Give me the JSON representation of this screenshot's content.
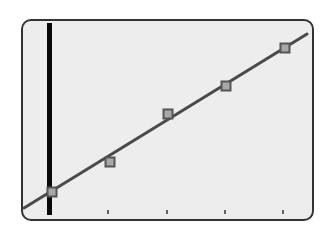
{
  "chart_data": {
    "type": "scatter",
    "title": "",
    "xlabel": "",
    "ylabel": "",
    "grid": false,
    "legend": null,
    "x_ticks": [
      1,
      2,
      3,
      4,
      5
    ],
    "tick_labels": [],
    "series": [
      {
        "name": "data points",
        "marker": "square",
        "x": [
          0,
          1,
          2,
          3,
          4
        ],
        "y": [
          0.08,
          0.18,
          0.47,
          0.63,
          0.85
        ]
      }
    ],
    "fit_line": {
      "name": "trend line",
      "x_range": [
        -0.5,
        4.2
      ],
      "y_range": [
        -0.02,
        0.93
      ]
    },
    "vertical_marker": {
      "x": 0,
      "style": "thick black bar"
    }
  },
  "colors": {
    "frame_border": "#333333",
    "plot_bg": "#ededed",
    "line": "#4a4a4a",
    "marker_fill": "#a8a8a8",
    "marker_stroke": "#555555",
    "vertical_bar": "#0a0a0a",
    "tick": "#333333"
  },
  "layout": {
    "frame": {
      "x": 22,
      "y": 20,
      "w": 291,
      "h": 200,
      "r": 9
    },
    "points_px": [
      {
        "x": 52,
        "y": 192
      },
      {
        "x": 110,
        "y": 162
      },
      {
        "x": 168,
        "y": 114
      },
      {
        "x": 226,
        "y": 86
      },
      {
        "x": 285,
        "y": 48
      }
    ],
    "line_px": {
      "x1": 24,
      "y1": 208,
      "x2": 307,
      "y2": 34
    },
    "bar_px": {
      "x": 47,
      "y": 23,
      "w": 5,
      "h": 192
    },
    "ticks_px": [
      {
        "x": 108
      },
      {
        "x": 167
      },
      {
        "x": 225
      },
      {
        "x": 283
      }
    ],
    "tick_y": 210,
    "tick_len": 4
  }
}
